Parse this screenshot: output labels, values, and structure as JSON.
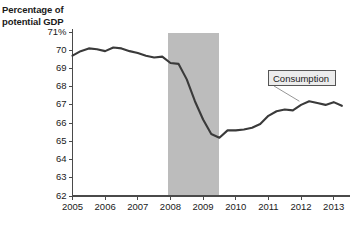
{
  "figure": {
    "axis_title_lines": [
      "Percentage of",
      "potential GDP"
    ],
    "background_color": "#ffffff",
    "line_color": "#3a3a3a",
    "axis_color": "#4a4a4a",
    "recession_band_color": "#bcbcbc",
    "callout_fill": "#ececec",
    "callout_border": "#555555"
  },
  "callout": {
    "label": "Consumption"
  },
  "chart_data": {
    "type": "line",
    "title": "",
    "subtitle": "",
    "xlabel": "",
    "ylabel": "Percentage of potential GDP",
    "xlim": [
      2005,
      2013.5
    ],
    "ylim": [
      62,
      71
    ],
    "grid": false,
    "legend_position": "inline-callout",
    "y_ticks": [
      62,
      63,
      64,
      65,
      66,
      67,
      68,
      69,
      70,
      71
    ],
    "y_tick_labels": [
      "62",
      "63",
      "64",
      "65",
      "66",
      "67",
      "68",
      "69",
      "70",
      "71%"
    ],
    "x_ticks": [
      2005,
      2006,
      2007,
      2008,
      2009,
      2010,
      2011,
      2012,
      2013
    ],
    "x_tick_labels": [
      "2005",
      "2006",
      "2007",
      "2008",
      "2009",
      "2010",
      "2011",
      "2012",
      "2013"
    ],
    "annotations": [
      {
        "text": "Consumption",
        "type": "callout-box",
        "points_to_x": 2011.95,
        "points_to_y": 67.2
      }
    ],
    "shaded_regions": [
      {
        "label": "recession",
        "x_start": 2007.92,
        "x_end": 2009.5,
        "color": "#bcbcbc"
      }
    ],
    "series": [
      {
        "name": "Consumption",
        "color": "#3a3a3a",
        "x": [
          2005.0,
          2005.25,
          2005.5,
          2005.75,
          2006.0,
          2006.25,
          2006.5,
          2006.75,
          2007.0,
          2007.25,
          2007.5,
          2007.75,
          2008.0,
          2008.25,
          2008.5,
          2008.75,
          2009.0,
          2009.25,
          2009.5,
          2009.75,
          2010.0,
          2010.25,
          2010.5,
          2010.75,
          2011.0,
          2011.25,
          2011.5,
          2011.75,
          2012.0,
          2012.25,
          2012.5,
          2012.75,
          2013.0,
          2013.25
        ],
        "values": [
          69.7,
          69.95,
          70.1,
          70.05,
          69.95,
          70.15,
          70.1,
          69.95,
          69.85,
          69.7,
          69.6,
          69.65,
          69.3,
          69.25,
          68.4,
          67.2,
          66.2,
          65.4,
          65.2,
          65.6,
          65.6,
          65.65,
          65.75,
          65.95,
          66.4,
          66.65,
          66.75,
          66.7,
          67.0,
          67.2,
          67.1,
          67.0,
          67.15,
          66.95
        ]
      }
    ]
  }
}
